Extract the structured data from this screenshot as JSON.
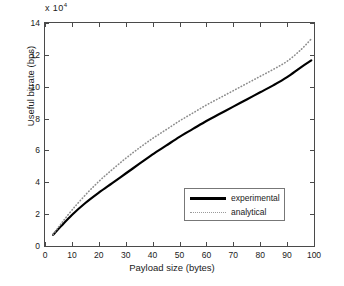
{
  "chart_data": {
    "type": "line",
    "title": "",
    "xlabel": "Payload size (bytes)",
    "ylabel": "Useful bitrate (bps)",
    "y_exponent_label": "x 10",
    "y_exponent_power": "4",
    "y_scale_multiplier": 10000,
    "xlim": [
      0,
      100
    ],
    "ylim": [
      0,
      14
    ],
    "xticks": [
      0,
      10,
      20,
      30,
      40,
      50,
      60,
      70,
      80,
      90,
      100
    ],
    "xtick_labels": [
      "0",
      "10",
      "20",
      "30",
      "40",
      "50",
      "60",
      "70",
      "80",
      "90",
      "100"
    ],
    "yticks": [
      0,
      2,
      4,
      6,
      8,
      10,
      12,
      14
    ],
    "ytick_labels": [
      "0",
      "2",
      "4",
      "6",
      "8",
      "10",
      "12",
      "14"
    ],
    "grid": false,
    "legend_position": "lower right",
    "x": [
      3,
      6,
      10,
      15,
      20,
      25,
      30,
      35,
      40,
      45,
      50,
      55,
      60,
      65,
      70,
      75,
      80,
      85,
      90,
      95,
      99
    ],
    "series": [
      {
        "name": "experimental",
        "style": "solid",
        "color": "#000000",
        "width": 2.2,
        "values": [
          0.7,
          1.25,
          1.95,
          2.7,
          3.35,
          3.95,
          4.55,
          5.15,
          5.75,
          6.3,
          6.85,
          7.35,
          7.85,
          8.3,
          8.75,
          9.2,
          9.65,
          10.1,
          10.6,
          11.2,
          11.65
        ]
      },
      {
        "name": "analytical",
        "style": "dotted",
        "color": "#8d8d8d",
        "width": 1.6,
        "values": [
          0.72,
          1.4,
          2.25,
          3.2,
          4.05,
          4.8,
          5.5,
          6.15,
          6.75,
          7.3,
          7.85,
          8.35,
          8.85,
          9.3,
          9.75,
          10.2,
          10.65,
          11.1,
          11.6,
          12.3,
          13.0
        ]
      }
    ]
  },
  "legend": {
    "items": [
      {
        "label": "experimental"
      },
      {
        "label": "analytical"
      }
    ]
  }
}
